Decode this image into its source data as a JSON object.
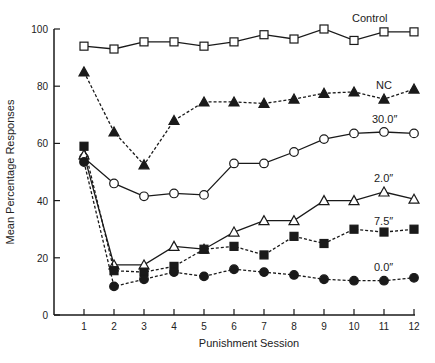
{
  "chart_data": {
    "type": "line",
    "title": "",
    "xlabel": "Punishment Session",
    "ylabel": "Mean Percentage Responses",
    "xlim": [
      0,
      12.3
    ],
    "ylim": [
      0,
      100
    ],
    "x": [
      1,
      2,
      3,
      4,
      5,
      6,
      7,
      8,
      9,
      10,
      11,
      12
    ],
    "x_ticks": [
      "1",
      "2",
      "3",
      "4",
      "5",
      "6",
      "7",
      "8",
      "9",
      "10",
      "11",
      "12"
    ],
    "y_ticks": [
      "0",
      "20",
      "40",
      "60",
      "80",
      "100"
    ],
    "grid": false,
    "legend_position": "inline labels at right end of each series",
    "series": [
      {
        "name": "Control",
        "marker": "open-square",
        "line": "solid",
        "values": [
          94,
          93,
          95.5,
          95.5,
          94,
          95.5,
          98,
          96.5,
          100,
          96,
          99,
          99
        ]
      },
      {
        "name": "NC",
        "marker": "filled-triangle",
        "line": "dotted",
        "values": [
          85,
          64,
          52.5,
          68,
          74.5,
          74.5,
          74,
          75.5,
          77.5,
          78,
          75.5,
          79
        ]
      },
      {
        "name": "30.0″",
        "marker": "open-circle",
        "line": "solid",
        "values": [
          55,
          46,
          41.5,
          42.5,
          42,
          53,
          53,
          57,
          61.5,
          63.5,
          64,
          63.5
        ]
      },
      {
        "name": "2.0″",
        "marker": "open-triangle",
        "line": "solid",
        "values": [
          56,
          17.5,
          17.5,
          24,
          23,
          29,
          33,
          33,
          40,
          40,
          43,
          40.5
        ]
      },
      {
        "name": "7.5″",
        "marker": "filled-square",
        "line": "dotted",
        "values": [
          59,
          15.5,
          15,
          17,
          23,
          24,
          21,
          27.5,
          25,
          30,
          29,
          30
        ]
      },
      {
        "name": "0.0″",
        "marker": "filled-circle",
        "line": "dotted",
        "values": [
          53.5,
          10,
          12.5,
          15,
          13.5,
          16,
          15,
          14,
          12.5,
          12,
          12,
          13
        ]
      }
    ]
  },
  "colors": {
    "ink": "#1a1a1a",
    "background": "#ffffff"
  }
}
